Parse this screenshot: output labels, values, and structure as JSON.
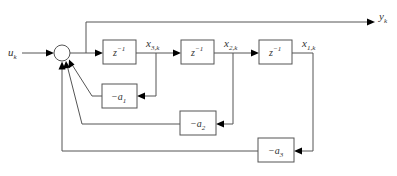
{
  "diagram": {
    "type": "block-diagram",
    "input": {
      "label": "u",
      "sub": "k"
    },
    "output": {
      "label": "y",
      "sub": "k"
    },
    "summing_junction": {
      "symbol": "circle"
    },
    "delay_blocks": [
      {
        "label": "z",
        "sup": "−1",
        "output_state": {
          "label": "x",
          "sub": "3,k"
        }
      },
      {
        "label": "z",
        "sup": "−1",
        "output_state": {
          "label": "x",
          "sub": "2,k"
        }
      },
      {
        "label": "z",
        "sup": "−1",
        "output_state": {
          "label": "x",
          "sub": "1,k"
        }
      }
    ],
    "gain_blocks": [
      {
        "label": "−a",
        "sub": "1"
      },
      {
        "label": "−a",
        "sub": "2"
      },
      {
        "label": "−a",
        "sub": "3"
      }
    ],
    "colors": {
      "line": "#555555",
      "arrow": "#000000",
      "text": "#333333"
    }
  }
}
